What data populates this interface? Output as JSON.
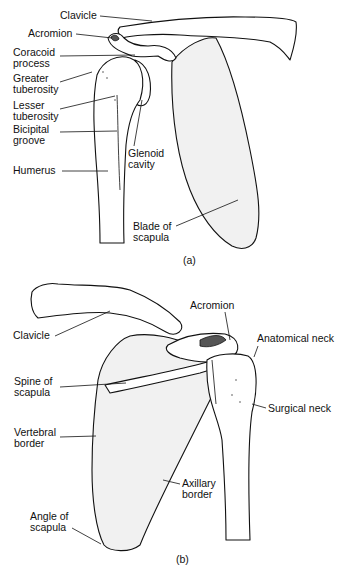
{
  "figure": {
    "panel_a": {
      "caption": "(a)",
      "labels": [
        {
          "id": "clavicle",
          "lines": [
            "Clavicle"
          ]
        },
        {
          "id": "acromion",
          "lines": [
            "Acromion"
          ]
        },
        {
          "id": "coracoid",
          "lines": [
            "Coracoid",
            "process"
          ]
        },
        {
          "id": "greater-tuberosity",
          "lines": [
            "Greater",
            "tuberosity"
          ]
        },
        {
          "id": "lesser-tuberosity",
          "lines": [
            "Lesser",
            "tuberosity"
          ]
        },
        {
          "id": "bicipital-groove",
          "lines": [
            "Bicipital",
            "groove"
          ]
        },
        {
          "id": "humerus",
          "lines": [
            "Humerus"
          ]
        },
        {
          "id": "glenoid-cavity",
          "lines": [
            "Glenoid",
            "cavity"
          ]
        },
        {
          "id": "blade-of-scapula",
          "lines": [
            "Blade of",
            "scapula"
          ]
        }
      ]
    },
    "panel_b": {
      "caption": "(b)",
      "labels": [
        {
          "id": "clavicle",
          "lines": [
            "Clavicle"
          ]
        },
        {
          "id": "acromion",
          "lines": [
            "Acromion"
          ]
        },
        {
          "id": "anatomical-neck",
          "lines": [
            "Anatomical neck"
          ]
        },
        {
          "id": "spine-of-scapula",
          "lines": [
            "Spine of",
            "scapula"
          ]
        },
        {
          "id": "surgical-neck",
          "lines": [
            "Surgical neck"
          ]
        },
        {
          "id": "vertebral-border",
          "lines": [
            "Vertebral",
            "border"
          ]
        },
        {
          "id": "axillary-border",
          "lines": [
            "Axillary",
            "border"
          ]
        },
        {
          "id": "angle-of-scapula",
          "lines": [
            "Angle of",
            "scapula"
          ]
        }
      ]
    }
  }
}
